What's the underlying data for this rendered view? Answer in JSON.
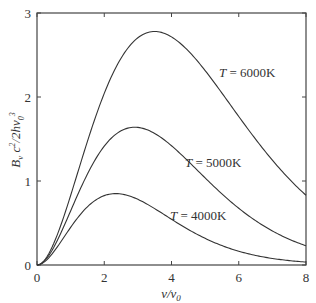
{
  "chart_data": {
    "type": "line",
    "title": "",
    "xlabel": "ν/ν0",
    "ylabel": "Bν c²/2hν0³",
    "xlim": [
      0,
      8
    ],
    "ylim": [
      0,
      3
    ],
    "xticks": [
      0,
      2,
      4,
      6,
      8
    ],
    "yticks": [
      0,
      1,
      2,
      3
    ],
    "grid": false,
    "legend": "inline labels",
    "x": [
      0,
      0.5,
      1,
      1.5,
      2,
      2.5,
      3,
      3.5,
      4,
      4.5,
      5,
      5.5,
      6,
      6.5,
      7,
      7.5,
      8
    ],
    "series": [
      {
        "name": "T = 6000K",
        "values": [
          0,
          0.12,
          0.66,
          1.41,
          2.11,
          2.56,
          2.77,
          2.78,
          2.64,
          2.42,
          2.15,
          1.87,
          1.59,
          1.33,
          1.1,
          0.9,
          0.82
        ]
      },
      {
        "name": "T = 5000K",
        "values": [
          0,
          0.12,
          0.59,
          1.14,
          1.52,
          1.64,
          1.63,
          1.44,
          1.2,
          0.95,
          0.73,
          0.55,
          0.4,
          0.29,
          0.21,
          0.15,
          0.2
        ]
      },
      {
        "name": "T = 4000K",
        "values": [
          0,
          0.14,
          0.51,
          0.78,
          0.85,
          0.85,
          0.72,
          0.55,
          0.4,
          0.27,
          0.18,
          0.12,
          0.07,
          0.05,
          0.03,
          0.02,
          0.03
        ]
      }
    ],
    "annotations": [
      {
        "text": "T = 6000K",
        "x": 5.6,
        "y": 2.4
      },
      {
        "text": "T = 5000K",
        "x": 4.6,
        "y": 1.4
      },
      {
        "text": "T = 4000K",
        "x": 3.5,
        "y": 0.7
      }
    ]
  },
  "labels": {
    "xlabel_main": "ν/ν",
    "xlabel_sub": "0",
    "ylabel": "Bν c²/2hν0³",
    "curve_6000": "T = 6000K",
    "curve_5000": "T = 5000K",
    "curve_4000": "T = 4000K"
  }
}
